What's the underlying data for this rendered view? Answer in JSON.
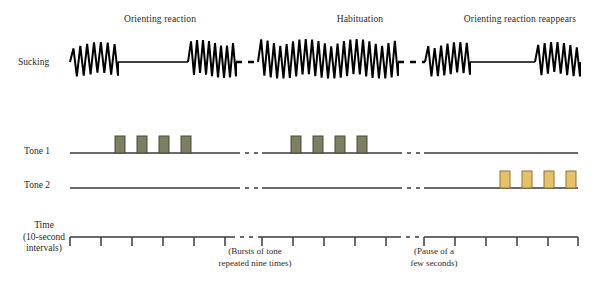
{
  "figure": {
    "width": 608,
    "height": 281,
    "background": "#ffffff",
    "ink": "#1a1a1a"
  },
  "section_titles": [
    {
      "key": "orienting-reaction",
      "label": "Orienting reaction",
      "x": 160,
      "y": 14
    },
    {
      "key": "habituation",
      "label": "Habituation",
      "x": 360,
      "y": 14
    },
    {
      "key": "orienting-reaction-reappears",
      "label": "Orienting reaction reappears",
      "x": 520,
      "y": 14
    }
  ],
  "rows": [
    {
      "key": "sucking",
      "label": "Sucking",
      "label_x": 18,
      "label_y": 57,
      "baseline_y": 62
    },
    {
      "key": "tone-1",
      "label": "Tone 1",
      "label_x": 24,
      "label_y": 146,
      "baseline_y": 153
    },
    {
      "key": "tone-2",
      "label": "Tone 2",
      "label_x": 24,
      "label_y": 180,
      "baseline_y": 188
    },
    {
      "key": "time",
      "label_lines": [
        "Time",
        "(10-second",
        "intervals)"
      ],
      "label_x": 44,
      "label_y": 226,
      "baseline_y": 237
    }
  ],
  "axis_notes": [
    {
      "key": "bursts-of-tone",
      "lines": [
        "(Bursts of tone",
        "repeated nine times)"
      ],
      "x": 255,
      "y": 247
    },
    {
      "key": "pause-of-a-few-seconds",
      "lines": [
        "(Pause of a",
        "few seconds)"
      ],
      "x": 434,
      "y": 247
    }
  ],
  "colors": {
    "tone1_fill": "#7d7f63",
    "tone1_stroke": "#4a4b39",
    "tone2_fill": "#e6c168",
    "tone2_stroke": "#8d7430",
    "trace": "#000000",
    "baseline": "#3a3a3a",
    "axis": "#3a3a3a"
  },
  "chart_data": {
    "type": "line",
    "xlabel": "Time (10-second intervals)",
    "ylabel": "",
    "grid": false,
    "legend": "none",
    "x_range": [
      70,
      578
    ],
    "series": [
      {
        "name": "Sucking",
        "type": "oscillation-trace",
        "baseline_y": 62,
        "segments": [
          {
            "kind": "burst",
            "x0": 70,
            "x1": 118,
            "cycles": 7,
            "amp": 20,
            "note": "vigorous sucking before tone"
          },
          {
            "kind": "flat",
            "x0": 118,
            "x1": 188,
            "note": "sucking suppressed - orienting reaction"
          },
          {
            "kind": "burst",
            "x0": 188,
            "x1": 236,
            "cycles": 8,
            "amp": 22,
            "note": "sucking resumes"
          },
          {
            "kind": "gap",
            "x0": 236,
            "x1": 258,
            "note": "dashed break in record"
          },
          {
            "kind": "burst",
            "x0": 258,
            "x1": 398,
            "cycles": 22,
            "amp": 23,
            "note": "habituation - sucking continues through tone"
          },
          {
            "kind": "gap",
            "x0": 398,
            "x1": 425,
            "note": "dashed break in record"
          },
          {
            "kind": "burst",
            "x0": 425,
            "x1": 470,
            "cycles": 7,
            "amp": 20,
            "note": "sucking before new tone"
          },
          {
            "kind": "flat",
            "x0": 470,
            "x1": 535,
            "note": "sucking suppressed - orienting reaction reappears"
          },
          {
            "kind": "burst",
            "x0": 535,
            "x1": 580,
            "cycles": 7,
            "amp": 20,
            "note": "sucking resumes"
          }
        ]
      },
      {
        "name": "Tone 1",
        "type": "pulse-train",
        "baseline_y": 153,
        "baseline_x0": 70,
        "baseline_x1": 578,
        "gaps": [
          [
            236,
            262
          ],
          [
            398,
            424
          ]
        ],
        "pulse_width": 10,
        "pulse_height": 17,
        "pulses_x": [
          115,
          137,
          159,
          181,
          291,
          313,
          335,
          357
        ],
        "count": 8
      },
      {
        "name": "Tone 2",
        "type": "pulse-train",
        "baseline_y": 188,
        "baseline_x0": 70,
        "baseline_x1": 578,
        "gaps": [
          [
            236,
            262
          ],
          [
            398,
            424
          ]
        ],
        "pulse_width": 10,
        "pulse_height": 17,
        "pulses_x": [
          500,
          522,
          544,
          566
        ],
        "count": 4
      }
    ],
    "time_axis": {
      "y": 237,
      "x0": 70,
      "x1": 578,
      "tick_height": 9,
      "interval_seconds": 10,
      "gaps": [
        [
          231,
          262
        ],
        [
          397,
          424
        ]
      ],
      "ticks_x": [
        70,
        101,
        132,
        163,
        194,
        225,
        262,
        293,
        324,
        355,
        386,
        424,
        455,
        486,
        517,
        548,
        578
      ]
    }
  }
}
